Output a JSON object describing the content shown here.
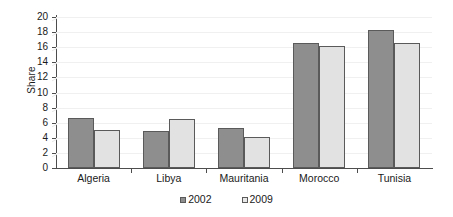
{
  "chart_data": {
    "type": "bar",
    "title": "",
    "xlabel": "",
    "ylabel": "Share",
    "categories": [
      "Algeria",
      "Libya",
      "Mauritania",
      "Morocco",
      "Tunisia"
    ],
    "series": [
      {
        "name": "2002",
        "color": "#8e8e8e",
        "values": [
          6.6,
          4.9,
          5.3,
          16.6,
          18.3
        ]
      },
      {
        "name": "2009",
        "color": "#e2e2e2",
        "values": [
          5.0,
          6.5,
          4.1,
          16.1,
          16.6
        ]
      }
    ],
    "ylim": [
      0,
      20
    ],
    "yticks": [
      0,
      2,
      4,
      6,
      8,
      10,
      12,
      14,
      16,
      18,
      20
    ],
    "ytick_labels": [
      "0",
      "2",
      "4",
      "6",
      "8",
      "10",
      "12",
      "14",
      "16",
      "18",
      "20"
    ],
    "grid": true,
    "legend_position": "bottom"
  }
}
